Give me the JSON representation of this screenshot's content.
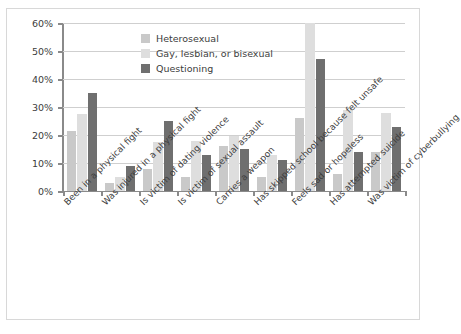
{
  "chart_data": {
    "type": "bar",
    "title": "",
    "subtitle": "",
    "xlabel": "",
    "ylabel": "",
    "ylim": [
      0,
      60
    ],
    "ytick_labels": [
      "0%",
      "10%",
      "20%",
      "30%",
      "40%",
      "50%",
      "60%"
    ],
    "ytick_values": [
      0,
      10,
      20,
      30,
      40,
      50,
      60
    ],
    "grid": true,
    "legend_position": "upper-center",
    "categories": [
      "Been in a physical fight",
      "Was injured in a physical fight",
      "Is victim of dating violence",
      "Is victim of sexual assault",
      "Carries a weapon",
      "Has skipped school because felt unsafe",
      "Feels sad or hopeless",
      "Has attempted suicide",
      "Was victim of cyberbullying"
    ],
    "series": [
      {
        "name": "Heterosexual",
        "color": "#c9c9c9",
        "values": [
          21.5,
          3,
          8,
          5,
          16,
          5,
          26,
          6,
          14
        ]
      },
      {
        "name": "Gay, lesbian, or bisexual",
        "color": "#dedede",
        "values": [
          27.5,
          5,
          17.5,
          18,
          19.5,
          13,
          60,
          29,
          28
        ]
      },
      {
        "name": "Questioning",
        "color": "#6f6f6f",
        "values": [
          35,
          9,
          25,
          13,
          15,
          11,
          47,
          14,
          23
        ]
      }
    ]
  },
  "frame": {
    "border_color": "#d8d8d8",
    "background": "#ffffff"
  }
}
